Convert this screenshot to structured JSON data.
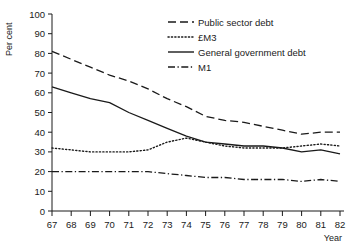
{
  "chart_data": {
    "type": "line",
    "title": "",
    "xlabel": "Year",
    "ylabel": "Per cent",
    "xlim": [
      67,
      82
    ],
    "ylim": [
      0,
      100
    ],
    "grid": false,
    "legend_position": "top-right",
    "x": [
      67,
      68,
      69,
      70,
      71,
      72,
      73,
      74,
      75,
      76,
      77,
      78,
      79,
      80,
      81,
      82
    ],
    "xtick_labels": [
      "67",
      "68",
      "69",
      "70",
      "71",
      "72",
      "73",
      "74",
      "75",
      "76",
      "77",
      "78",
      "79",
      "80",
      "81",
      "82"
    ],
    "ytick_labels": [
      "0",
      "10",
      "20",
      "30",
      "40",
      "50",
      "60",
      "70",
      "80",
      "90",
      "100"
    ],
    "ytick_values": [
      0,
      10,
      20,
      30,
      40,
      50,
      60,
      70,
      80,
      90,
      100
    ],
    "series": [
      {
        "name": "Public sector debt",
        "style": "dashed",
        "color": "#1a1a1a",
        "values": [
          81,
          77,
          73,
          69,
          66,
          62,
          57,
          53,
          48,
          46,
          45,
          43,
          41,
          39,
          40,
          40
        ]
      },
      {
        "name": "£M3",
        "style": "dotted",
        "color": "#1a1a1a",
        "values": [
          32,
          31,
          30,
          30,
          30,
          31,
          35,
          37,
          35,
          33,
          32,
          32,
          32,
          33,
          34,
          33
        ]
      },
      {
        "name": "General government debt",
        "style": "solid",
        "color": "#1a1a1a",
        "values": [
          63,
          60,
          57,
          55,
          50,
          46,
          42,
          38,
          35,
          34,
          33,
          33,
          32,
          30,
          31,
          29
        ]
      },
      {
        "name": "M1",
        "style": "dashdot",
        "color": "#1a1a1a",
        "values": [
          20,
          20,
          20,
          20,
          20,
          20,
          19,
          18,
          17,
          17,
          16,
          16,
          16,
          15,
          16,
          15
        ]
      }
    ]
  },
  "axis": {
    "y_title": "Per cent",
    "x_title": "Year"
  }
}
